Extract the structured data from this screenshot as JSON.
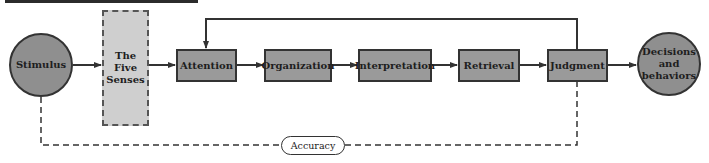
{
  "diagram": {
    "nodes": {
      "stimulus": {
        "label": "Stimulus",
        "shape": "circle"
      },
      "five_senses": {
        "label_line1": "The",
        "label_line2": "Five",
        "label_line3": "Senses",
        "shape": "dashed-rectangle"
      },
      "attention": {
        "label": "Attention",
        "shape": "rectangle"
      },
      "organization": {
        "label": "Organization",
        "shape": "rectangle"
      },
      "interpretation": {
        "label": "Interpretation",
        "shape": "rectangle"
      },
      "retrieval": {
        "label": "Retrieval",
        "shape": "rectangle"
      },
      "judgment": {
        "label": "Judgment",
        "shape": "rectangle"
      },
      "decisions": {
        "label_line1": "Decisions",
        "label_line2": "and",
        "label_line3": "behaviors",
        "shape": "circle"
      }
    },
    "accuracy": {
      "label": "Accuracy"
    },
    "edges": [
      {
        "from": "Stimulus",
        "to": "The Five Senses",
        "style": "solid-arrow"
      },
      {
        "from": "The Five Senses",
        "to": "Attention",
        "style": "solid-arrow"
      },
      {
        "from": "Attention",
        "to": "Organization",
        "style": "solid-arrow"
      },
      {
        "from": "Organization",
        "to": "Interpretation",
        "style": "solid-arrow"
      },
      {
        "from": "Interpretation",
        "to": "Retrieval",
        "style": "solid-arrow"
      },
      {
        "from": "Retrieval",
        "to": "Judgment",
        "style": "solid-arrow"
      },
      {
        "from": "Judgment",
        "to": "Decisions and behaviors",
        "style": "solid-arrow"
      },
      {
        "from": "Judgment",
        "to": "Attention",
        "style": "solid-feedback-arrow"
      },
      {
        "from": "Stimulus",
        "to": "Judgment",
        "style": "dashed-comparison",
        "label": "Accuracy"
      }
    ],
    "colors": {
      "box_fill": "#9a9a9a",
      "circle_fill": "#8f8f8f",
      "senses_fill": "#cfcfcf",
      "stroke": "#333333"
    }
  }
}
